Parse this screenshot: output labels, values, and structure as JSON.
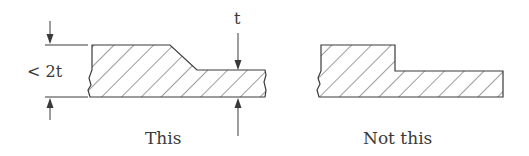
{
  "diagram": {
    "left_panel": {
      "caption": "This",
      "dimension_label": "< 2t",
      "thickness_label": "t"
    },
    "right_panel": {
      "caption": "Not this"
    },
    "colors": {
      "line": "#3a3a3a",
      "hatch": "#4a4a4a",
      "background": "#ffffff"
    }
  }
}
